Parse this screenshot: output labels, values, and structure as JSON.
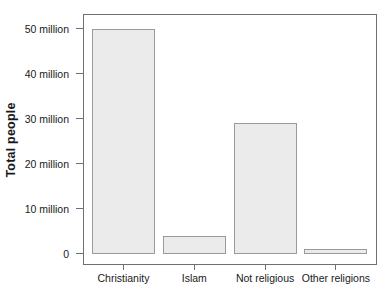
{
  "figure": {
    "background": "#ffffff"
  },
  "chart_data": {
    "type": "bar",
    "title": "",
    "xlabel": "",
    "ylabel": "Total people",
    "categories": [
      "Christianity",
      "Islam",
      "Not religious",
      "Other religions"
    ],
    "values": [
      50,
      4,
      29,
      1
    ],
    "unit": "million people",
    "ylim": [
      0,
      50
    ],
    "yticks": [
      {
        "value": 0,
        "label": "0"
      },
      {
        "value": 10,
        "label": "10 million"
      },
      {
        "value": 20,
        "label": "20 million"
      },
      {
        "value": 30,
        "label": "30 million"
      },
      {
        "value": 40,
        "label": "40 million"
      },
      {
        "value": 50,
        "label": "50 million"
      }
    ],
    "grid": false,
    "legend": "none",
    "colors": {
      "bar_fill": "#ebebeb",
      "bar_border": "#9a9a9a",
      "axis": "#707070",
      "text": "#1a1a1a"
    }
  }
}
